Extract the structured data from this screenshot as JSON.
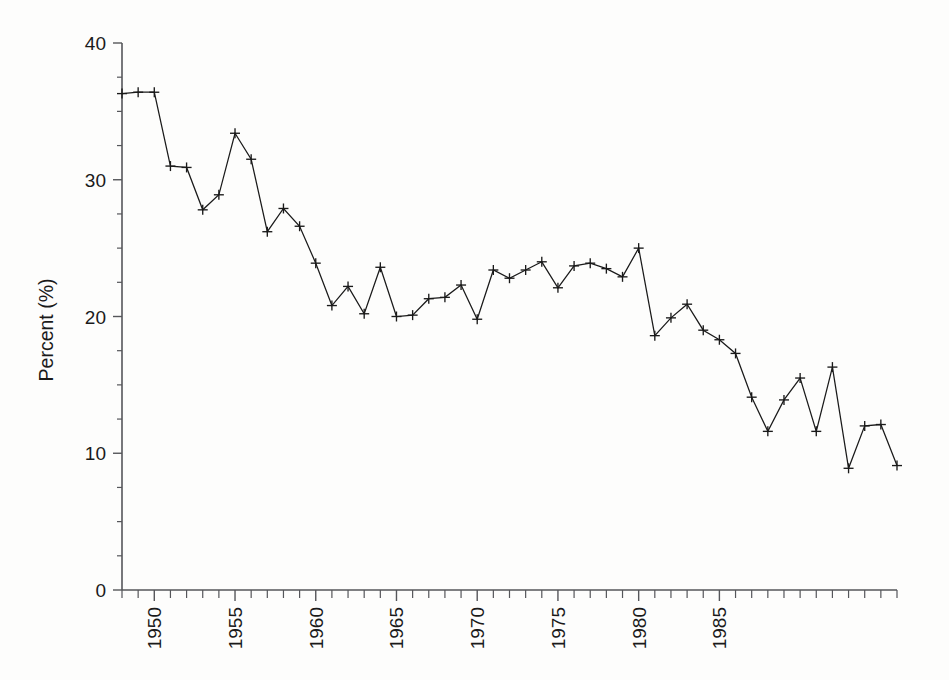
{
  "chart_data": {
    "type": "line",
    "title": "",
    "subtitle": "",
    "xlabel": "",
    "ylabel": "Percent (%)",
    "xlim": [
      1948,
      1990
    ],
    "ylim": [
      0,
      40
    ],
    "yticks": [
      0,
      10,
      20,
      30,
      40
    ],
    "ytick_labels": [
      "0",
      "10",
      "20",
      "30",
      "40"
    ],
    "xticks": [
      1950,
      1955,
      1960,
      1965,
      1970,
      1975,
      1980,
      1985
    ],
    "xtick_labels": [
      "1950",
      "1955",
      "1960",
      "1965",
      "1970",
      "1975",
      "1980",
      "1985"
    ],
    "xtick_minor_step": 1,
    "ytick_minor_step": 2.5,
    "grid": false,
    "legend": null,
    "marker": "plus",
    "line_color": "#1a1a1a",
    "axis_color": "#55565a",
    "background": "#fdfdfc",
    "x": [
      1948,
      1949,
      1950,
      1951,
      1952,
      1953,
      1954,
      1955,
      1956,
      1957,
      1958,
      1959,
      1960,
      1961,
      1962,
      1963,
      1964,
      1965,
      1966,
      1967,
      1968,
      1969,
      1970,
      1971,
      1972,
      1973,
      1974,
      1975,
      1976,
      1977,
      1978,
      1979,
      1980,
      1981,
      1982,
      1983,
      1984,
      1985,
      1986,
      1987,
      1988,
      1989,
      1990
    ],
    "values": [
      36.3,
      36.4,
      36.4,
      31.0,
      30.9,
      27.8,
      28.9,
      33.4,
      31.5,
      26.2,
      27.9,
      26.6,
      23.9,
      20.8,
      22.2,
      20.2,
      23.6,
      20.0,
      20.1,
      21.3,
      21.4,
      22.3,
      19.8,
      23.4,
      22.8,
      23.4,
      24.0,
      22.1,
      23.7,
      23.9,
      23.5,
      22.9,
      25.0,
      18.6,
      19.9,
      20.9,
      19.0,
      18.3,
      17.3,
      14.1,
      11.6,
      13.9,
      15.5
    ],
    "values_tail_note": "",
    "series_extra_x": [
      1991,
      1992,
      1993,
      1994,
      1995
    ],
    "series_extra_values": [
      11.6,
      16.3,
      8.9,
      12.0,
      12.1
    ],
    "full_x_count": 48,
    "final_value": 9.1,
    "units": "%"
  },
  "axis": {
    "y_title": "Percent (%)"
  }
}
